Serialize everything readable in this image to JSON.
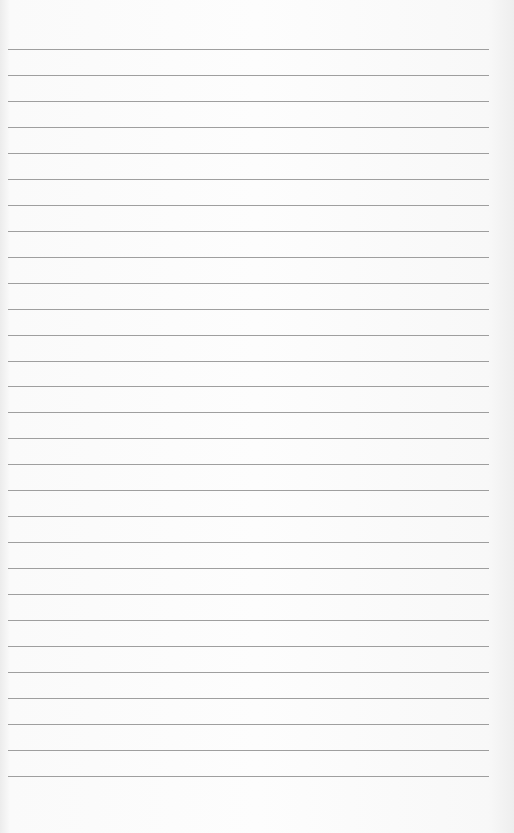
{
  "page": {
    "type": "lined-paper",
    "line_count": 29,
    "first_line_y": 49,
    "line_spacing": 25.96,
    "line_left": 8,
    "line_width": 481,
    "line_color": "#8e8e8e",
    "paper_color": "#fdfdfd"
  }
}
